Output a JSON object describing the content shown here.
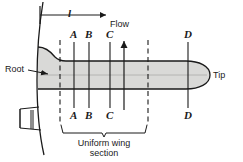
{
  "figure": {
    "colors": {
      "wing_fill": "#d9d9d7",
      "outline": "#1a1a1a",
      "background": "#ffffff",
      "text": "#1a1a1a"
    },
    "dimension_label": "l",
    "flow_label": "Flow",
    "root_label": "Root",
    "tip_label": "Tip",
    "brace_caption_line1": "Uniform wing",
    "brace_caption_line2": "section",
    "section_labels_top": [
      {
        "text": "A",
        "x": 74
      },
      {
        "text": "B",
        "x": 89
      },
      {
        "text": "C",
        "x": 110
      },
      {
        "text": "D",
        "x": 188
      }
    ],
    "section_labels_bottom": [
      {
        "text": "A",
        "x": 74
      },
      {
        "text": "B",
        "x": 89
      },
      {
        "text": "C",
        "x": 110
      },
      {
        "text": "D",
        "x": 188
      }
    ],
    "section_lines": [
      {
        "name": "A",
        "x": 74,
        "style": "solid"
      },
      {
        "name": "B",
        "x": 89,
        "style": "solid"
      },
      {
        "name": "C",
        "x": 110,
        "style": "solid"
      },
      {
        "name": "D",
        "x": 188,
        "style": "solid"
      }
    ],
    "boundary_lines": [
      {
        "name": "inner-boundary",
        "x": 60,
        "style": "dashed"
      },
      {
        "name": "outer-boundary",
        "x": 148,
        "style": "dashed"
      }
    ],
    "flow_arrow_x": 124
  }
}
